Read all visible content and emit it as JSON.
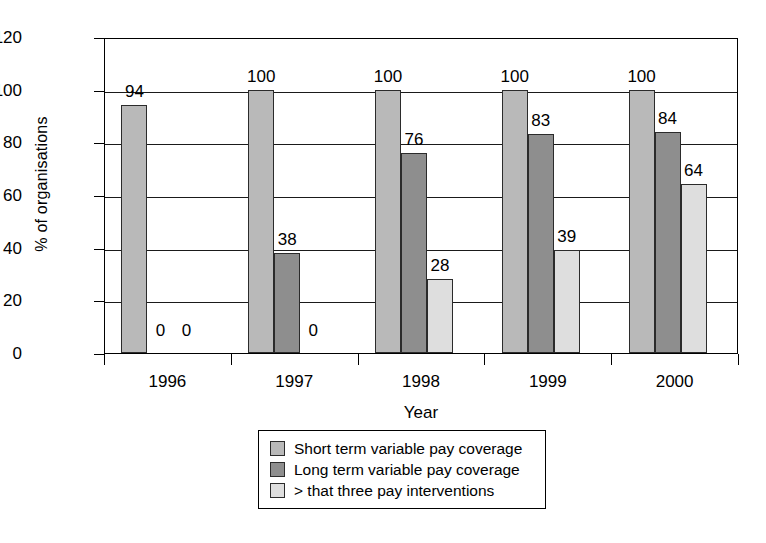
{
  "chart_data": {
    "type": "bar",
    "title": "",
    "xlabel": "Year",
    "ylabel": "% of organisations",
    "categories": [
      "1996",
      "1997",
      "1998",
      "1999",
      "2000"
    ],
    "ylim": [
      0,
      120
    ],
    "yticks": [
      0,
      20,
      40,
      60,
      80,
      100,
      120
    ],
    "ytick_labels": [
      "0",
      "20",
      "40",
      "60",
      "80",
      "100",
      "120"
    ],
    "grid": true,
    "legend_position": "bottom-center",
    "series": [
      {
        "name": "Short term variable pay coverage",
        "color": "#b9b9b9",
        "values": [
          94,
          100,
          100,
          100,
          100
        ],
        "labels": [
          "94",
          "100",
          "100",
          "100",
          "100"
        ]
      },
      {
        "name": "Long term variable pay coverage",
        "color": "#8e8e8e",
        "values": [
          0,
          38,
          76,
          83,
          84
        ],
        "labels": [
          "0",
          "38",
          "76",
          "83",
          "84"
        ]
      },
      {
        "name": "> that three pay interventions",
        "color": "#dedede",
        "values": [
          0,
          0,
          28,
          39,
          64
        ],
        "labels": [
          "0",
          "0",
          "28",
          "39",
          "64"
        ]
      }
    ]
  },
  "legend": {
    "items": [
      {
        "label": "Short term variable pay coverage",
        "color": "#b9b9b9"
      },
      {
        "label": "Long term variable pay coverage",
        "color": "#8e8e8e"
      },
      {
        "label": "> that three pay interventions",
        "color": "#dedede"
      }
    ]
  }
}
